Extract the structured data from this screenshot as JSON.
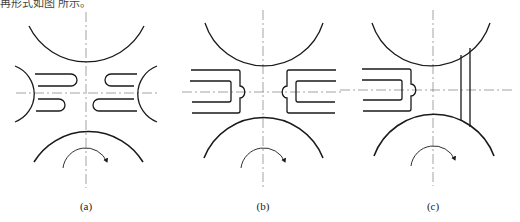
{
  "header": {
    "text": "再形式如图 所示。"
  },
  "panels": [
    {
      "id": "a",
      "label": "(a)"
    },
    {
      "id": "b",
      "label": "(b)"
    },
    {
      "id": "c",
      "label": "(c)"
    }
  ],
  "colors": {
    "stroke": "#1a1a1a",
    "axis": "#555555"
  }
}
